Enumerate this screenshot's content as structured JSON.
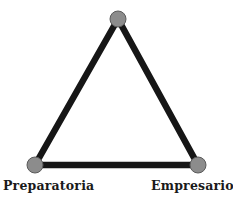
{
  "diagram": {
    "type": "triangle",
    "edge_color": "#161616",
    "node_fill": "#8c8c8c",
    "node_stroke": "#5a5a5a",
    "nodes": [
      {
        "id": "top",
        "label": "",
        "x": 118,
        "y": 19
      },
      {
        "id": "bottom-left",
        "label": "Preparatoria",
        "x": 35,
        "y": 165
      },
      {
        "id": "bottom-right",
        "label": "Empresario",
        "x": 198,
        "y": 165
      }
    ],
    "edges": [
      [
        "top",
        "bottom-left"
      ],
      [
        "top",
        "bottom-right"
      ],
      [
        "bottom-left",
        "bottom-right"
      ]
    ]
  },
  "labels": {
    "left": "Preparatoria",
    "right": "Empresario"
  }
}
